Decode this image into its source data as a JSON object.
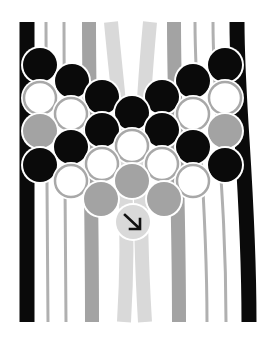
{
  "diagram": {
    "type": "friendship-bracelet-knot-pattern",
    "colors": {
      "black": "#0a0a0a",
      "mid_gray": "#a3a3a3",
      "light_gray": "#d9d9d9",
      "thin_gray": "#b0b0b0",
      "white": "#ffffff",
      "outline": "#a8a8a8",
      "arrow": "#111111"
    },
    "strings": [
      {
        "id": 1,
        "color": "black",
        "width": 15,
        "top_x": 27,
        "bottom_x": 27
      },
      {
        "id": 2,
        "color": "thin_gray",
        "width": 3,
        "top_x": 46,
        "bottom_x": 48
      },
      {
        "id": 3,
        "color": "thin_gray",
        "width": 3,
        "top_x": 64,
        "bottom_x": 66
      },
      {
        "id": 4,
        "color": "mid_gray",
        "width": 14,
        "top_x": 89,
        "bottom_x": 92
      },
      {
        "id": 5,
        "color": "light_gray",
        "width": 14,
        "top_x": 111,
        "bottom_x": 124
      },
      {
        "id": 6,
        "color": "light_gray",
        "width": 14,
        "top_x": 150,
        "bottom_x": 145
      },
      {
        "id": 7,
        "color": "mid_gray",
        "width": 14,
        "top_x": 174,
        "bottom_x": 179
      },
      {
        "id": 8,
        "color": "thin_gray",
        "width": 3,
        "top_x": 195,
        "bottom_x": 207
      },
      {
        "id": 9,
        "color": "thin_gray",
        "width": 3,
        "top_x": 213,
        "bottom_x": 226
      },
      {
        "id": 10,
        "color": "black",
        "width": 15,
        "top_x": 237,
        "bottom_x": 249
      }
    ],
    "knots": [
      {
        "row": 1,
        "cx": 40,
        "cy": 65,
        "color": "black"
      },
      {
        "row": 1,
        "cx": 225,
        "cy": 65,
        "color": "black"
      },
      {
        "row": 2,
        "cx": 72,
        "cy": 81,
        "color": "black"
      },
      {
        "row": 2,
        "cx": 193,
        "cy": 81,
        "color": "black"
      },
      {
        "row": 3,
        "cx": 40,
        "cy": 98,
        "color": "white"
      },
      {
        "row": 3,
        "cx": 102,
        "cy": 97,
        "color": "black"
      },
      {
        "row": 3,
        "cx": 162,
        "cy": 97,
        "color": "black"
      },
      {
        "row": 3,
        "cx": 225,
        "cy": 98,
        "color": "white"
      },
      {
        "row": 4,
        "cx": 71,
        "cy": 114,
        "color": "white"
      },
      {
        "row": 4,
        "cx": 132,
        "cy": 113,
        "color": "black"
      },
      {
        "row": 4,
        "cx": 193,
        "cy": 114,
        "color": "white"
      },
      {
        "row": 5,
        "cx": 40,
        "cy": 131,
        "color": "mid_gray"
      },
      {
        "row": 5,
        "cx": 102,
        "cy": 130,
        "color": "black"
      },
      {
        "row": 5,
        "cx": 162,
        "cy": 130,
        "color": "black"
      },
      {
        "row": 5,
        "cx": 225,
        "cy": 131,
        "color": "mid_gray"
      },
      {
        "row": 6,
        "cx": 71,
        "cy": 147,
        "color": "black"
      },
      {
        "row": 6,
        "cx": 132,
        "cy": 146,
        "color": "white"
      },
      {
        "row": 6,
        "cx": 193,
        "cy": 147,
        "color": "black"
      },
      {
        "row": 7,
        "cx": 40,
        "cy": 165,
        "color": "black"
      },
      {
        "row": 7,
        "cx": 102,
        "cy": 164,
        "color": "white"
      },
      {
        "row": 7,
        "cx": 162,
        "cy": 164,
        "color": "white"
      },
      {
        "row": 7,
        "cx": 225,
        "cy": 165,
        "color": "black"
      },
      {
        "row": 8,
        "cx": 71,
        "cy": 181,
        "color": "white"
      },
      {
        "row": 8,
        "cx": 132,
        "cy": 181,
        "color": "mid_gray"
      },
      {
        "row": 8,
        "cx": 193,
        "cy": 181,
        "color": "white"
      },
      {
        "row": 9,
        "cx": 101,
        "cy": 199,
        "color": "mid_gray"
      },
      {
        "row": 9,
        "cx": 164,
        "cy": 199,
        "color": "mid_gray"
      },
      {
        "row": 10,
        "cx": 133,
        "cy": 222,
        "color": "light_gray",
        "arrow": "down-right"
      }
    ],
    "knot_radius": 17,
    "string_top_y": 22,
    "string_bottom_y": 322
  }
}
